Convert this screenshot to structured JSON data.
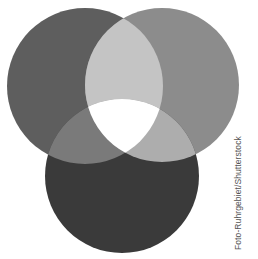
{
  "diagram": {
    "type": "three-circle-overlap",
    "circles": [
      {
        "name": "left",
        "cx": 85,
        "cy": 86,
        "r": 78,
        "color": "#5e5e5e"
      },
      {
        "name": "right",
        "cx": 162,
        "cy": 85,
        "r": 77,
        "color": "#8c8c8c"
      },
      {
        "name": "bottom",
        "cx": 122,
        "cy": 176,
        "r": 77,
        "color": "#3a3a3a"
      }
    ],
    "overlaps": {
      "left_right": "#c4c4c4",
      "left_bottom": "#7a7a7a",
      "right_bottom": "#adadad",
      "center": "#ffffff"
    }
  },
  "credit": "Foto-Ruhrgebiet/Shutterstock"
}
